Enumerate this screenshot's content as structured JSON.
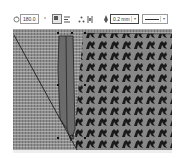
{
  "toolbar": {
    "rotation_icon": "rotate-icon",
    "rotation_value": "180.0",
    "degree_symbol": "°",
    "icons": [
      "wrap-text-icon",
      "align-icon",
      "shape-nodes-icon",
      "distribute-icon",
      "pen-icon"
    ],
    "outline_width": "0.2 mm",
    "line_style": "solid-line"
  },
  "canvas": {
    "pattern_fill": "houndstooth",
    "base_fill_color": "#8e8e8e",
    "pattern_color": "#1a1a1a",
    "selected_shape_color": "#6b6b6b",
    "outline_color": "#1e1e1e"
  }
}
